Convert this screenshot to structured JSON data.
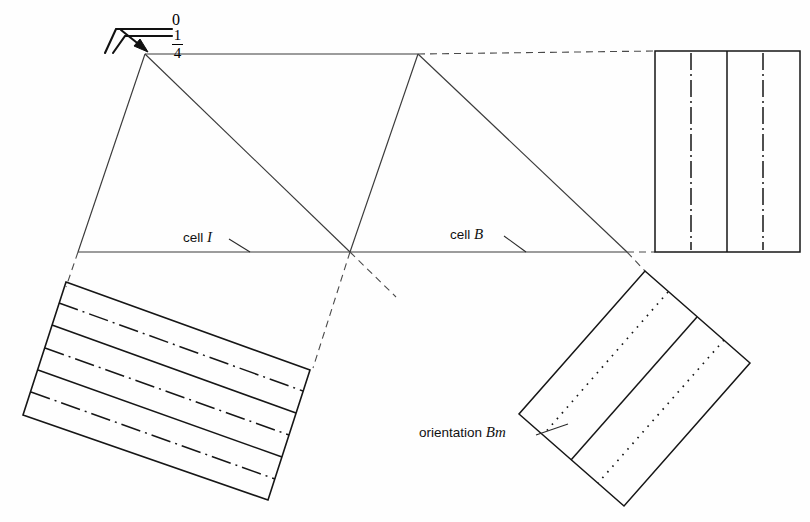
{
  "figure": {
    "type": "technical-line-drawing",
    "background": "#fefefe",
    "line_color": "#2b2b2b",
    "heavy_line_color": "#111111"
  },
  "labels": {
    "cell_i": {
      "prefix": "cell ",
      "symbol": "I"
    },
    "cell_b": {
      "prefix": "cell ",
      "symbol": "B"
    },
    "orientation_bm": {
      "prefix": "orientation ",
      "symbol": "Bm"
    }
  },
  "symbol": {
    "name": "orientation-marker",
    "top_value": "0",
    "fraction_numerator": "1",
    "fraction_denominator": "4"
  },
  "panels": {
    "top_right": {
      "name": "panel-vertical-dashdot",
      "pattern": "dash-dot vertical centerlines",
      "solid_dividers": 1,
      "dashdot_lines": 2
    },
    "bottom_left": {
      "name": "panel-tilted-dashdot",
      "pattern": "alternating solid and dash-dot bands",
      "solid_dividers": 2,
      "dashdot_lines": 2
    },
    "bottom_right": {
      "name": "panel-diagonal-dotted",
      "pattern": "dotted lines in rotated rectangle",
      "solid_dividers": 1,
      "dotted_lines": 2
    }
  },
  "geometry": {
    "main_vertices": {
      "top_left": [
        145,
        54
      ],
      "top_mid": [
        418,
        54
      ],
      "left": [
        78,
        252
      ],
      "center": [
        350,
        252
      ],
      "right": [
        627,
        252
      ]
    }
  }
}
